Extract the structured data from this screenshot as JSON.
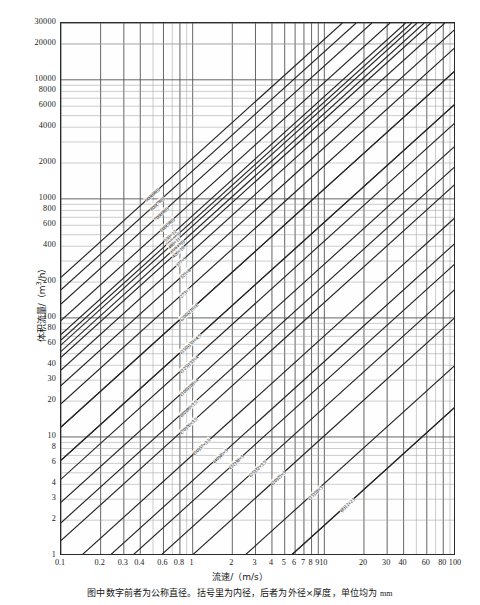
{
  "chart_data": {
    "type": "line",
    "title": "",
    "xlabel": "流速/（m/s）",
    "ylabel": "体积流量/（m³/h）",
    "xscale": "log",
    "yscale": "log",
    "xlim": [
      0.1,
      100
    ],
    "ylim": [
      1,
      30000
    ],
    "grid": true,
    "legend": "inline-on-curve",
    "xticks": [
      "0.1",
      "0.2",
      "0.3",
      "0.4",
      "0.6",
      "0.8",
      "1",
      "2",
      "3",
      "4",
      "5",
      "6",
      "7",
      "8",
      "9",
      "10",
      "20",
      "30",
      "40",
      "60",
      "80",
      "100"
    ],
    "xtick_values": [
      0.1,
      0.2,
      0.3,
      0.4,
      0.6,
      0.8,
      1,
      2,
      3,
      4,
      5,
      6,
      7,
      8,
      9,
      10,
      20,
      30,
      40,
      60,
      80,
      100
    ],
    "yticks": [
      "1",
      "2",
      "3",
      "4",
      "6",
      "8",
      "10",
      "20",
      "30",
      "40",
      "60",
      "80",
      "100",
      "200",
      "400",
      "600",
      "800",
      "1000",
      "2000",
      "4000",
      "6000",
      "8000",
      "10000",
      "20000",
      "30000"
    ],
    "ytick_values": [
      1,
      2,
      3,
      4,
      6,
      8,
      10,
      20,
      30,
      40,
      60,
      80,
      100,
      200,
      400,
      600,
      800,
      1000,
      2000,
      4000,
      6000,
      8000,
      10000,
      20000,
      30000
    ],
    "note": "Each diagonal line is a pipe size: volumetric flow Q = v × A, slope +1 on log-log. Label lists nominal diameter, (inner diameter) and outer diameter × wall thickness in mm.",
    "series": [
      {
        "name": "900(880)",
        "label": "900(880)",
        "inner_mm": 880,
        "area_m2": 0.608212
      },
      {
        "name": "800(780)",
        "label": "800(780)",
        "inner_mm": 780,
        "area_m2": 0.477836
      },
      {
        "name": "700(680)",
        "label": "700(680)",
        "inner_mm": 680,
        "area_m2": 0.363168
      },
      {
        "name": "600(580)",
        "label": "600(580)",
        "inner_mm": 580,
        "area_m2": 0.264208
      },
      {
        "name": "500(480)",
        "label": "500(480)",
        "inner_mm": 480,
        "area_m2": 0.180956
      },
      {
        "name": "450(430)",
        "label": "450(430)",
        "inner_mm": 430,
        "area_m2": 0.14522
      },
      {
        "name": "530x12",
        "label": "530×12",
        "inner_mm": 506,
        "area_m2": 0.201129
      },
      {
        "name": "480x11",
        "label": "480×11",
        "inner_mm": 458,
        "area_m2": 0.164748
      },
      {
        "name": "426x10",
        "label": "426×10",
        "inner_mm": 406,
        "area_m2": 0.129462
      },
      {
        "name": "377x9",
        "label": "377×9",
        "inner_mm": 359,
        "area_m2": 0.101213
      },
      {
        "name": "325x8",
        "label": "325×8",
        "inner_mm": 309,
        "area_m2": 0.074984
      },
      {
        "name": "273x7",
        "label": "273×7",
        "inner_mm": 259,
        "area_m2": 0.052685
      },
      {
        "name": "219x6",
        "label": "219×6",
        "inner_mm": 207,
        "area_m2": 0.033654
      },
      {
        "name": "(200)219x6",
        "label": "(200)219×6",
        "inner_mm": 207,
        "area_m2": 0.033654
      },
      {
        "name": "159x4.5",
        "label": "159×4.5",
        "inner_mm": 150,
        "area_m2": 0.017671
      },
      {
        "name": "(150)159x4.5",
        "label": "(150)159×4.5",
        "inner_mm": 150,
        "area_m2": 0.017671
      },
      {
        "name": "(125)133x4",
        "label": "(125)133×4",
        "inner_mm": 125,
        "area_m2": 0.012272
      },
      {
        "name": "(100)108x4",
        "label": "(100)108×4",
        "inner_mm": 100,
        "area_m2": 0.007854
      },
      {
        "name": "(80)89x3.5",
        "label": "(80)89×3.5",
        "inner_mm": 82,
        "area_m2": 0.005281
      },
      {
        "name": "(70)76x3.5",
        "label": "(70)76×3.5",
        "inner_mm": 69,
        "area_m2": 0.003739
      },
      {
        "name": "(50)57x3.5",
        "label": "(50)57×3.5",
        "inner_mm": 50,
        "area_m2": 0.001963
      },
      {
        "name": "(40)45x3",
        "label": "(40)45×3",
        "inner_mm": 39,
        "area_m2": 0.001195
      },
      {
        "name": "(32)38x3",
        "label": "(32)38×3",
        "inner_mm": 32,
        "area_m2": 0.000804
      },
      {
        "name": "(25)32x3.5",
        "label": "(25)32×3.5",
        "inner_mm": 25,
        "area_m2": 0.000491
      },
      {
        "name": "(20)25x3",
        "label": "(20)25×3",
        "inner_mm": 19,
        "area_m2": 0.000284
      },
      {
        "name": "(15)18x3",
        "label": "(15)18×3",
        "inner_mm": 12,
        "area_m2": 0.000113
      },
      {
        "name": "(10)14x3",
        "label": "(10)14×3",
        "inner_mm": 8,
        "area_m2": 5.03e-05
      },
      {
        "name": "(8)12x2",
        "label": "(8)12×2",
        "inner_mm": 8,
        "area_m2": 5.03e-05
      }
    ]
  },
  "axes": {
    "y_title": "体积流量/（m",
    "y_title_sup": "3",
    "y_title_tail": "/h）",
    "x_title": "流速/（m/s）"
  },
  "caption": {
    "text_cn": "图中数字前者为公称直径。括号里为内径，后者为外径×厚度，单位均为 ",
    "text_unit": "mm"
  }
}
